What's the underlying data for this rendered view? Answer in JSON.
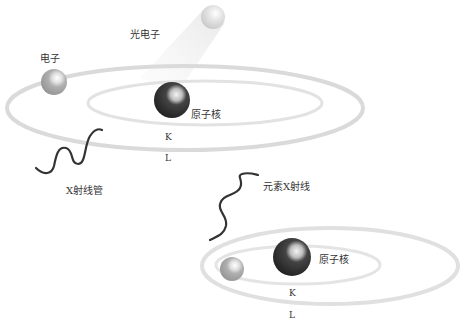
{
  "diagram": {
    "type": "x-ray fluorescence / photoelectric effect illustration",
    "top_atom": {
      "electron_label": "电子",
      "photoelectron_label": "光电子",
      "nucleus_label": "原子核",
      "shell_k": "K",
      "shell_l": "L",
      "incident_wave_label": "X射线管"
    },
    "bottom_atom": {
      "emitted_wave_label": "元素X射线",
      "nucleus_label": "原子核",
      "shell_k": "K",
      "shell_l": "L"
    },
    "colors": {
      "orbit": "#d9d9d9",
      "nucleus": "#2b2b2b",
      "electron": "#a8a8a8",
      "wave": "#3a3a3a",
      "text": "#333333"
    }
  }
}
